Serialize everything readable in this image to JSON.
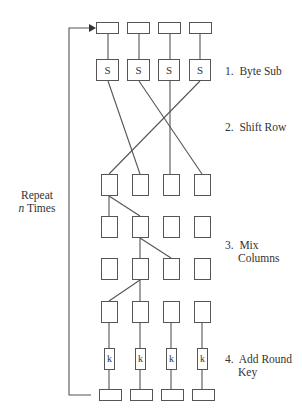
{
  "diagram": {
    "title_cutoff": "",
    "loop_label": {
      "line1": "Repeat",
      "line2_var": "n",
      "line2_rest": " Times"
    },
    "steps": [
      {
        "num": "1.",
        "text": "Byte Sub"
      },
      {
        "num": "2.",
        "text": "Shift Row"
      },
      {
        "num": "3.",
        "text": "Mix",
        "text2": "Columns"
      },
      {
        "num": "4.",
        "text": "Add Round",
        "text2": "Key"
      }
    ],
    "sbox_label": "S",
    "key_label": "k",
    "columns": 4,
    "shift_row_mapping": [
      {
        "from": 1,
        "to": 2
      },
      {
        "from": 2,
        "to": 4
      },
      {
        "from": 3,
        "to": 3
      },
      {
        "from": 4,
        "to": 1
      }
    ]
  }
}
